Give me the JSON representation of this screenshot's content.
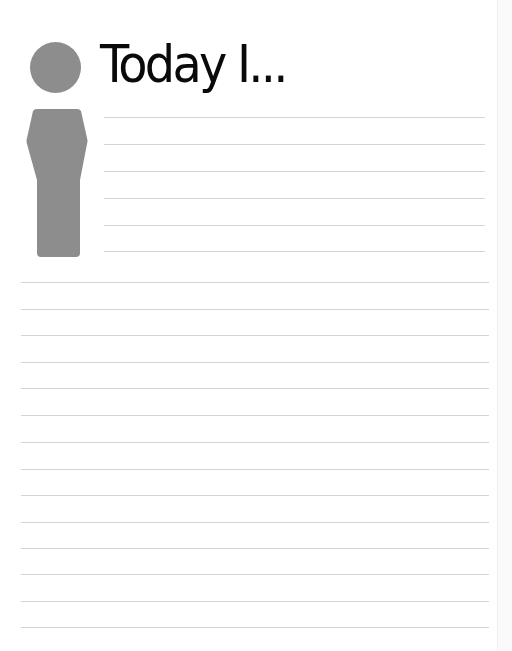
{
  "page": {
    "title": "Today I...",
    "colors": {
      "figure": "#8d8d8d",
      "lines": "#d4d4d4",
      "title": "#0a0a0a",
      "background": "#ffffff"
    },
    "short_lines": {
      "x": 104,
      "right": 485,
      "ys": [
        117,
        144,
        171,
        198,
        225,
        251
      ]
    },
    "full_lines": {
      "x": 21,
      "right": 489,
      "ys": [
        282,
        309,
        335,
        362,
        388,
        415,
        442,
        469,
        495,
        522,
        548,
        574,
        601,
        627
      ]
    }
  }
}
